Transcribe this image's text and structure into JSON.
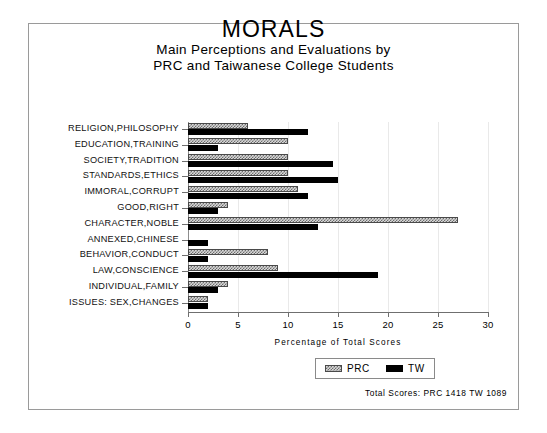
{
  "chart_data": {
    "type": "bar",
    "orientation": "horizontal",
    "title": "MORALS",
    "subtitle_lines": [
      "Main Perceptions and Evaluations by",
      "PRC and Taiwanese College Students"
    ],
    "xlabel": "Percentage of Total Scores",
    "ylabel": "",
    "xlim": [
      0,
      30
    ],
    "xticks": [
      0,
      5,
      10,
      15,
      20,
      25,
      30
    ],
    "grid": true,
    "legend_position": "bottom-right",
    "categories": [
      "RELIGION,PHILOSOPHY",
      "EDUCATION,TRAINING",
      "SOCIETY,TRADITION",
      "STANDARDS,ETHICS",
      "IMMORAL,CORRUPT",
      "GOOD,RIGHT",
      "CHARACTER,NOBLE",
      "ANNEXED,CHINESE",
      "BEHAVIOR,CONDUCT",
      "LAW,CONSCIENCE",
      "INDIVIDUAL,FAMILY",
      "ISSUES: SEX,CHANGES"
    ],
    "series": [
      {
        "name": "PRC",
        "values": [
          6.0,
          10.0,
          10.0,
          10.0,
          11.0,
          4.0,
          27.0,
          0.0,
          8.0,
          9.0,
          4.0,
          2.0
        ]
      },
      {
        "name": "TW",
        "values": [
          12.0,
          3.0,
          14.5,
          15.0,
          12.0,
          3.0,
          13.0,
          2.0,
          2.0,
          19.0,
          3.0,
          2.0
        ]
      }
    ],
    "annotation": "Total Scores:  PRC 1418  TW 1089"
  },
  "legend": {
    "items": [
      {
        "label": "PRC",
        "pattern": "hatched"
      },
      {
        "label": "TW",
        "pattern": "solid"
      }
    ]
  },
  "colors": {
    "tw_fill": "#000000",
    "prc_fill": "#d8d8d8",
    "prc_hatch": "#6e6e6e",
    "axis": "#6f6f6f",
    "grid": "#e9e9e9",
    "frame": "#9a9a9a"
  }
}
